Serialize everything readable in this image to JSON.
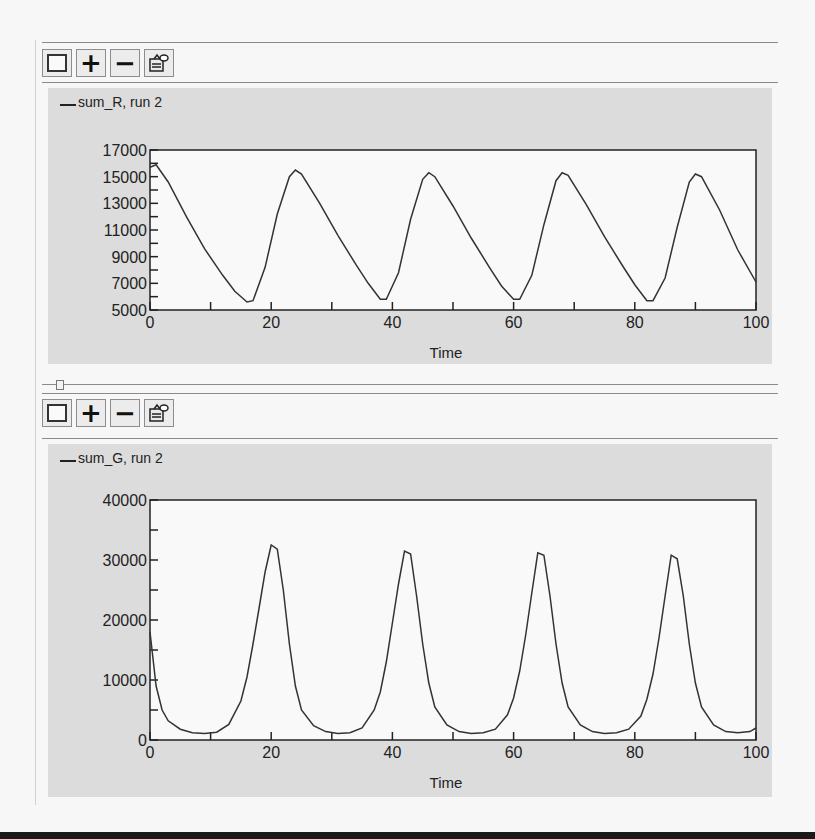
{
  "toolbar_icons": [
    "square-outline-icon",
    "plus-icon",
    "minus-icon",
    "properties-icon"
  ],
  "toolbar_labels": {
    "plus": "+",
    "minus": "−"
  },
  "panels": [
    {
      "legend": "sum_R, run 2",
      "xlabel": "Time",
      "x_ticks": [
        "0",
        "20",
        "40",
        "60",
        "80",
        "100"
      ],
      "y_ticks": [
        "17000",
        "15000",
        "13000",
        "11000",
        "9000",
        "7000",
        "5000"
      ]
    },
    {
      "legend": "sum_G, run 2",
      "xlabel": "Time",
      "x_ticks": [
        "0",
        "20",
        "40",
        "60",
        "80",
        "100"
      ],
      "y_ticks": [
        "40000",
        "30000",
        "20000",
        "10000",
        "0"
      ]
    }
  ],
  "chart_data": [
    {
      "type": "line",
      "title": "sum_R, run 2",
      "xlabel": "Time",
      "ylabel": "",
      "xlim": [
        0,
        100
      ],
      "ylim": [
        5000,
        17000
      ],
      "legend_position": "top-left",
      "grid": false,
      "series": [
        {
          "name": "sum_R, run 2",
          "x": [
            0,
            1,
            3,
            6,
            9,
            12,
            14,
            16,
            17,
            19,
            21,
            23,
            24,
            25,
            28,
            31,
            34,
            36,
            38,
            39,
            41,
            43,
            45,
            46,
            47,
            50,
            53,
            56,
            58,
            60,
            61,
            63,
            65,
            67,
            68,
            69,
            72,
            75,
            78,
            80,
            82,
            83,
            85,
            87,
            89,
            90,
            91,
            94,
            97,
            100
          ],
          "y": [
            15700,
            15900,
            14600,
            12000,
            9600,
            7600,
            6400,
            5600,
            5700,
            8200,
            12200,
            15000,
            15500,
            15200,
            13000,
            10600,
            8400,
            7000,
            5800,
            5800,
            7800,
            11800,
            14800,
            15300,
            15000,
            12800,
            10400,
            8200,
            6800,
            5800,
            5800,
            7600,
            11400,
            14700,
            15300,
            15100,
            12900,
            10500,
            8300,
            6900,
            5700,
            5700,
            7400,
            11200,
            14600,
            15200,
            15000,
            12500,
            9500,
            7100
          ]
        }
      ]
    },
    {
      "type": "line",
      "title": "sum_G, run 2",
      "xlabel": "Time",
      "ylabel": "",
      "xlim": [
        0,
        100
      ],
      "ylim": [
        0,
        40000
      ],
      "legend_position": "top-left",
      "grid": false,
      "series": [
        {
          "name": "sum_G, run 2",
          "x": [
            0,
            1,
            2,
            3,
            5,
            7,
            9,
            11,
            13,
            15,
            16,
            17,
            18,
            19,
            20,
            21,
            22,
            23,
            24,
            25,
            27,
            29,
            31,
            33,
            35,
            37,
            38,
            39,
            40,
            41,
            42,
            43,
            44,
            45,
            46,
            47,
            49,
            51,
            53,
            55,
            57,
            59,
            60,
            61,
            62,
            63,
            64,
            65,
            66,
            67,
            68,
            69,
            71,
            73,
            75,
            77,
            79,
            81,
            82,
            83,
            84,
            85,
            86,
            87,
            88,
            89,
            90,
            91,
            93,
            95,
            97,
            99,
            100
          ],
          "y": [
            18000,
            9000,
            5000,
            3200,
            1800,
            1200,
            1100,
            1300,
            2600,
            6500,
            10500,
            16000,
            22000,
            28000,
            32500,
            31800,
            25000,
            16000,
            9000,
            5000,
            2400,
            1400,
            1100,
            1200,
            2000,
            5000,
            8000,
            13000,
            19500,
            26000,
            31500,
            31000,
            24000,
            16000,
            9500,
            5500,
            2500,
            1400,
            1100,
            1200,
            1800,
            4200,
            7000,
            11500,
            17500,
            24500,
            31200,
            30800,
            24000,
            16000,
            9500,
            5500,
            2500,
            1400,
            1100,
            1200,
            1800,
            4000,
            6800,
            11000,
            17000,
            24000,
            30800,
            30200,
            24000,
            16000,
            9500,
            5500,
            2500,
            1400,
            1200,
            1400,
            2000
          ]
        }
      ]
    }
  ]
}
